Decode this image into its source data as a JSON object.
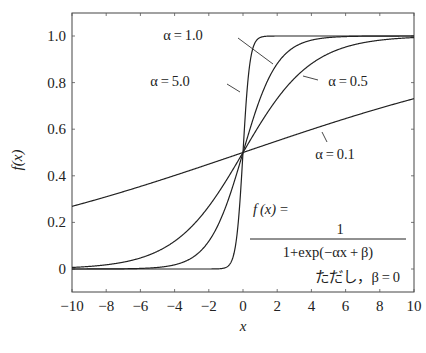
{
  "chart_data": {
    "type": "line",
    "title": "",
    "xlabel": "x",
    "ylabel": "f(x)",
    "xlim": [
      -10,
      10
    ],
    "ylim": [
      -0.1,
      1.1
    ],
    "grid": false,
    "legend_position": "inline annotations",
    "x_ticks": [
      -10,
      -8,
      -6,
      -4,
      -2,
      0,
      2,
      4,
      6,
      8,
      10
    ],
    "x_tick_labels": [
      "−10",
      "−8",
      "−6",
      "−4",
      "−2",
      "0",
      "2",
      "4",
      "6",
      "8",
      "10"
    ],
    "y_ticks": [
      0,
      0.2,
      0.4,
      0.6,
      0.8,
      1.0
    ],
    "y_tick_labels": [
      "0",
      "0.2",
      "0.4",
      "0.6",
      "0.8",
      "1.0"
    ],
    "formula": "f(x) = 1 / (1 + exp(-αx + β)), β = 0",
    "x": [
      -10,
      -8,
      -6,
      -4,
      -2,
      0,
      2,
      4,
      6,
      8,
      10
    ],
    "series": [
      {
        "name": "α=0.1",
        "alpha": 0.1,
        "values": [
          0.269,
          0.31,
          0.354,
          0.401,
          0.45,
          0.5,
          0.55,
          0.599,
          0.646,
          0.69,
          0.731
        ]
      },
      {
        "name": "α=0.5",
        "alpha": 0.5,
        "values": [
          0.007,
          0.018,
          0.047,
          0.119,
          0.269,
          0.5,
          0.731,
          0.881,
          0.953,
          0.982,
          0.993
        ]
      },
      {
        "name": "α=1.0",
        "alpha": 1.0,
        "values": [
          0.0,
          0.0,
          0.002,
          0.018,
          0.119,
          0.5,
          0.881,
          0.982,
          0.998,
          1.0,
          1.0
        ]
      },
      {
        "name": "α=5.0",
        "alpha": 5.0,
        "values": [
          0.0,
          0.0,
          0.0,
          0.0,
          0.0,
          0.5,
          1.0,
          1.0,
          1.0,
          1.0,
          1.0
        ]
      }
    ]
  },
  "labels": {
    "ylabel": "f(x)",
    "xlabel": "x",
    "alpha_1": "α = 1.0",
    "alpha_5": "α = 5.0",
    "alpha_05": "α = 0.5",
    "alpha_01": "α = 0.1",
    "formula_lhs": "f (x) =",
    "formula_num": "1",
    "formula_den": "1+exp(−αx + β)",
    "formula_note": "ただし，β = 0"
  }
}
